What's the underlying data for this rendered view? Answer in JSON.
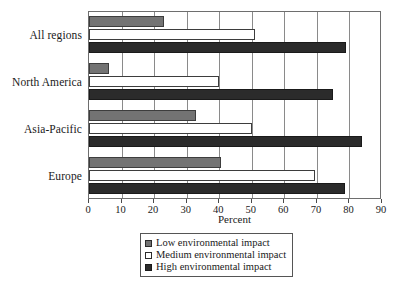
{
  "chart_data": {
    "type": "bar",
    "orientation": "horizontal",
    "title": "",
    "xlabel": "Percent",
    "ylabel": "",
    "xlim": [
      0,
      90
    ],
    "xticks": [
      0,
      10,
      20,
      30,
      40,
      50,
      60,
      70,
      80,
      90
    ],
    "xtick_labels": [
      "0",
      "10",
      "20",
      "30",
      "40",
      "50",
      "60",
      "70",
      "80",
      "90"
    ],
    "grid": "vertical",
    "legend_position": "bottom-center",
    "categories": [
      "All regions",
      "North America",
      "Asia-Pacific",
      "Europe"
    ],
    "series": [
      {
        "name": "Low environmental impact",
        "color": "#737373",
        "values": [
          23,
          6,
          33,
          40.5
        ]
      },
      {
        "name": "Medium environmental impact",
        "color": "#ffffff",
        "values": [
          51,
          40,
          50,
          69.5
        ]
      },
      {
        "name": "High environmental impact",
        "color": "#2b2b2b",
        "values": [
          79,
          75,
          84,
          78.5
        ]
      }
    ]
  },
  "legend": {
    "items": [
      {
        "label": "Low environmental impact",
        "swatch": "low"
      },
      {
        "label": "Medium environmental impact",
        "swatch": "medium"
      },
      {
        "label": "High environmental impact",
        "swatch": "high"
      }
    ]
  }
}
